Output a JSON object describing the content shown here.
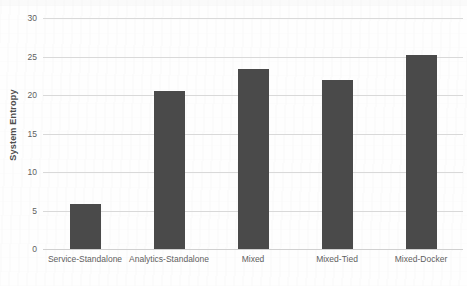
{
  "chart_data": {
    "type": "bar",
    "title": "",
    "subtitle": "",
    "xlabel": "",
    "ylabel": "System Entropy",
    "categories": [
      "Service-Standalone",
      "Analytics-Standalone",
      "Mixed",
      "Mixed-Tied",
      "Mixed-Docker"
    ],
    "values": [
      5.8,
      20.5,
      23.4,
      22.0,
      25.2
    ],
    "ylim": [
      0,
      30
    ],
    "ytick_labels": [
      "0",
      "5",
      "10",
      "15",
      "20",
      "25",
      "30"
    ],
    "ytick_values": [
      0,
      5,
      10,
      15,
      20,
      25,
      30
    ],
    "grid": "horizontal",
    "legend": "none",
    "bar_color": "#4a4a4a",
    "gridline_color": "#d9d9d9",
    "background_color": "#ffffff",
    "axis_text_color": "#595959"
  }
}
